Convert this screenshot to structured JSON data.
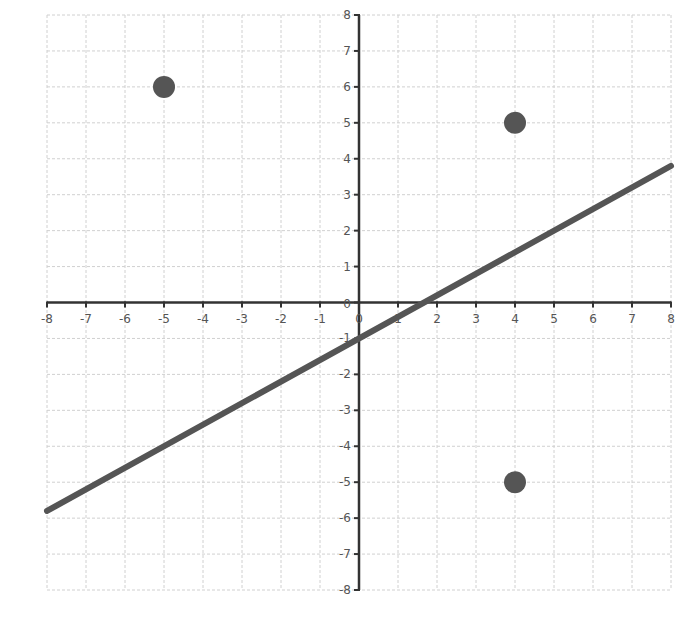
{
  "chart_data": {
    "type": "scatter",
    "title": "",
    "xlabel": "",
    "ylabel": "",
    "xlim": [
      -8,
      8
    ],
    "ylim": [
      -8,
      8
    ],
    "grid": true,
    "legend": null,
    "x_ticks": [
      "-8",
      "-7",
      "-6",
      "-5",
      "-4",
      "-3",
      "-2",
      "-1",
      "0",
      "1",
      "2",
      "3",
      "4",
      "5",
      "6",
      "7",
      "8"
    ],
    "y_ticks": [
      "-8",
      "-7",
      "-6",
      "-5",
      "-4",
      "-3",
      "-2",
      "-1",
      "0",
      "1",
      "2",
      "3",
      "4",
      "5",
      "6",
      "7",
      "8"
    ],
    "series": [
      {
        "name": "points",
        "type": "scatter",
        "color": "#555555",
        "points": [
          {
            "x": -5,
            "y": 6
          },
          {
            "x": 4,
            "y": 5
          },
          {
            "x": 4,
            "y": -5
          }
        ]
      },
      {
        "name": "line",
        "type": "line",
        "color": "#555555",
        "slope": 0.6,
        "intercept": -1,
        "points": [
          {
            "x": -8,
            "y": -5.8
          },
          {
            "x": 8,
            "y": 3.8
          }
        ]
      }
    ]
  },
  "colors": {
    "grid": "#d0d0d0",
    "axis": "#333333",
    "series": "#555555",
    "background": "#ffffff"
  }
}
